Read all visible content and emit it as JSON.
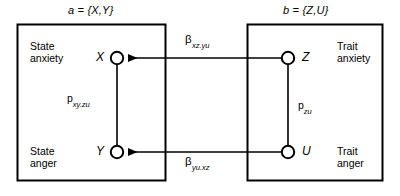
{
  "figure": {
    "type": "path-diagram",
    "background_color": "#ffffff",
    "line_color": "#000000"
  },
  "panels": [
    {
      "id": "a",
      "set_label": "a = {X,Y}",
      "constructs": [
        {
          "id": "state-anxiety",
          "line1": "State",
          "line2": "anxiety"
        },
        {
          "id": "state-anger",
          "line1": "State",
          "line2": "anger"
        }
      ]
    },
    {
      "id": "b",
      "set_label": "b = {Z,U}",
      "constructs": [
        {
          "id": "trait-anxiety",
          "line1": "Trait",
          "line2": "anxiety"
        },
        {
          "id": "trait-anger",
          "line1": "Trait",
          "line2": "anger"
        }
      ]
    }
  ],
  "nodes": [
    {
      "id": "X",
      "label": "X",
      "panel": "a",
      "position": "top-left"
    },
    {
      "id": "Y",
      "label": "Y",
      "panel": "a",
      "position": "bottom-left"
    },
    {
      "id": "Z",
      "label": "Z",
      "panel": "b",
      "position": "top-right"
    },
    {
      "id": "U",
      "label": "U",
      "panel": "b",
      "position": "bottom-right"
    }
  ],
  "paths": [
    {
      "id": "beta-xz-yu",
      "symbol": "β",
      "subscript": "xz.yu",
      "from": "Z",
      "to": "X",
      "kind": "directed-arrow"
    },
    {
      "id": "beta-yu-xz",
      "symbol": "β",
      "subscript": "yu.xz",
      "from": "U",
      "to": "Y",
      "kind": "directed-arrow"
    },
    {
      "id": "p-xy-zu",
      "symbol": "p",
      "subscript": "xy.zu",
      "from": "X",
      "to": "Y",
      "kind": "undirected-line"
    },
    {
      "id": "p-zu",
      "symbol": "p",
      "subscript": "zu",
      "from": "Z",
      "to": "U",
      "kind": "undirected-line"
    }
  ]
}
